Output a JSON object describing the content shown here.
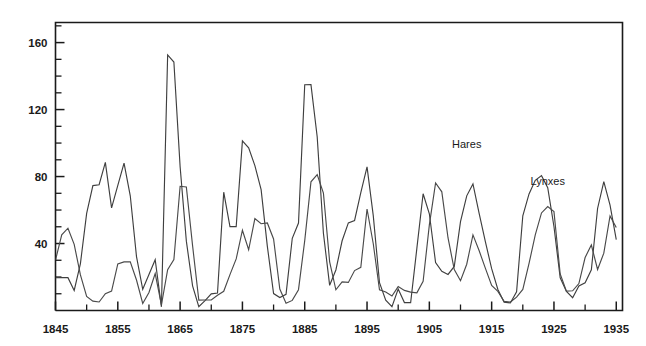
{
  "chart_data": {
    "type": "line",
    "title": "",
    "subtitle": "",
    "xlabel": "",
    "ylabel": "",
    "xlim": [
      1845,
      1936
    ],
    "ylim": [
      0,
      172
    ],
    "grid": false,
    "legend_position": "inline-annotation",
    "y_ticks_major": [
      40,
      80,
      120,
      160
    ],
    "y_ticks_major_labels": [
      "40",
      "80",
      "120",
      "160"
    ],
    "y_ticks_minor": [
      10,
      20,
      30,
      50,
      60,
      70,
      90,
      100,
      110,
      130,
      140,
      150,
      170
    ],
    "x_ticks_major": [
      1845,
      1855,
      1865,
      1875,
      1885,
      1895,
      1905,
      1915,
      1925,
      1935
    ],
    "x_ticks_major_labels": [
      "1845",
      "1855",
      "1865",
      "1875",
      "1885",
      "1895",
      "1905",
      "1915",
      "1925",
      "1935"
    ],
    "x_ticks_minor": [
      1850,
      1860,
      1870,
      1880,
      1890,
      1900,
      1910,
      1920,
      1930
    ],
    "annotations": [
      {
        "text": "Hares",
        "x": 1911,
        "y": 97
      },
      {
        "text": "Lynxes",
        "x": 1924,
        "y": 75
      }
    ],
    "x": [
      1845,
      1846,
      1847,
      1848,
      1849,
      1850,
      1851,
      1852,
      1853,
      1854,
      1855,
      1856,
      1857,
      1858,
      1859,
      1860,
      1861,
      1862,
      1863,
      1864,
      1865,
      1866,
      1867,
      1868,
      1869,
      1870,
      1871,
      1872,
      1873,
      1874,
      1875,
      1876,
      1877,
      1878,
      1879,
      1880,
      1881,
      1882,
      1883,
      1884,
      1885,
      1886,
      1887,
      1888,
      1889,
      1890,
      1891,
      1892,
      1893,
      1894,
      1895,
      1896,
      1897,
      1898,
      1899,
      1900,
      1901,
      1902,
      1903,
      1904,
      1905,
      1906,
      1907,
      1908,
      1909,
      1910,
      1911,
      1912,
      1913,
      1914,
      1915,
      1916,
      1917,
      1918,
      1919,
      1920,
      1921,
      1922,
      1923,
      1924,
      1925,
      1926,
      1927,
      1928,
      1929,
      1930,
      1931,
      1932,
      1933,
      1934,
      1935
    ],
    "series": [
      {
        "name": "Hares",
        "color": "#3f3f3f",
        "values": [
          19.58,
          19.6,
          19.61,
          11.99,
          28.04,
          58.0,
          74.6,
          75.09,
          88.48,
          61.28,
          74.67,
          88.06,
          68.51,
          32.19,
          12.64,
          21.49,
          30.35,
          2.18,
          152.65,
          148.36,
          85.81,
          41.41,
          14.75,
          2.28,
          5.91,
          9.95,
          10.44,
          70.64,
          50.12,
          50.13,
          101.25,
          97.12,
          86.51,
          72.17,
          38.32,
          10.11,
          7.74,
          9.67,
          43.12,
          52.21,
          134.85,
          134.86,
          103.79,
          46.1,
          15.03,
          24.2,
          41.65,
          52.34,
          53.78,
          70.4,
          85.81,
          56.69,
          16.59,
          6.16,
          2.3,
          12.82,
          4.72,
          4.73,
          37.22,
          69.72,
          57.78,
          28.68,
          23.37,
          21.54,
          26.34,
          53.1,
          68.48,
          75.58,
          57.92,
          40.97,
          24.95,
          12.59,
          4.97,
          4.5,
          11.21,
          56.6,
          69.63,
          77.74,
          80.53,
          73.38,
          50.15,
          19.52,
          11.42,
          7.63,
          14.62,
          16.55,
          24.35,
          60.92,
          76.95,
          62.91,
          42.3
        ]
      },
      {
        "name": "Lynxes",
        "color": "#4a4a4a",
        "values": [
          30.09,
          45.15,
          49.15,
          39.52,
          21.23,
          8.42,
          5.56,
          5.08,
          10.08,
          11.62,
          27.85,
          29.01,
          29.13,
          18.19,
          4.22,
          10.76,
          22.06,
          3.3,
          24.33,
          30.36,
          74.18,
          73.81,
          38.72,
          6.17,
          6.25,
          6.34,
          9.14,
          11.49,
          21.42,
          30.8,
          47.93,
          36.26,
          54.89,
          51.83,
          52.27,
          42.71,
          12.82,
          4.27,
          6.03,
          12.43,
          41.75,
          76.85,
          81.11,
          70.1,
          29.09,
          12.37,
          17.04,
          16.77,
          23.83,
          25.76,
          60.61,
          39.86,
          12.36,
          11.01,
          8.64,
          14.29,
          12.01,
          10.95,
          10.56,
          17.49,
          51.15,
          76.13,
          70.89,
          43.32,
          24.45,
          17.79,
          27.64,
          45.15,
          35.64,
          25.13,
          14.92,
          11.4,
          5.44,
          5.04,
          7.97,
          12.62,
          28.1,
          45.14,
          58.27,
          62.11,
          59.05,
          21.82,
          11.54,
          11.78,
          16.12,
          31.65,
          39.12,
          24.48,
          34.25,
          56.5,
          49.6
        ]
      }
    ]
  },
  "figure": {
    "background_color": "#ffffff",
    "axis_color": "#1a1a1a"
  }
}
